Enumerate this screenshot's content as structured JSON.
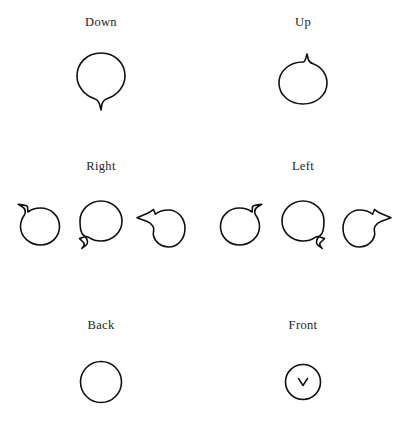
{
  "figure": {
    "background_color": "#ffffff",
    "stroke_color": "#111111",
    "text_color": "#1c1c1c",
    "rows": [
      {
        "name": "down-up",
        "groups": [
          {
            "label": "Down",
            "shapes": [
              {
                "name": "balloon-tail-down",
                "tail_direction": "down",
                "tail_position": "bottom-center",
                "has_chevron": false
              }
            ]
          },
          {
            "label": "Up",
            "shapes": [
              {
                "name": "balloon-tail-up",
                "tail_direction": "up",
                "tail_position": "top-center",
                "has_chevron": false
              }
            ]
          }
        ]
      },
      {
        "name": "right-left",
        "groups": [
          {
            "label": "Right",
            "shapes": [
              {
                "name": "balloon-tail-upper-left",
                "tail_direction": "upper-left",
                "tail_position": "top-left",
                "has_chevron": false
              },
              {
                "name": "balloon-tail-lower-left",
                "tail_direction": "lower-left",
                "tail_position": "bottom-left",
                "has_chevron": false
              },
              {
                "name": "balloon-tail-left",
                "tail_direction": "left",
                "tail_position": "mid-left",
                "has_chevron": false
              }
            ]
          },
          {
            "label": "Left",
            "shapes": [
              {
                "name": "balloon-tail-upper-right",
                "tail_direction": "upper-right",
                "tail_position": "top-right",
                "has_chevron": false
              },
              {
                "name": "balloon-tail-lower-right",
                "tail_direction": "lower-right",
                "tail_position": "bottom-right",
                "has_chevron": false
              },
              {
                "name": "balloon-tail-right",
                "tail_direction": "right",
                "tail_position": "mid-right",
                "has_chevron": false
              }
            ]
          }
        ]
      },
      {
        "name": "back-front",
        "groups": [
          {
            "label": "Back",
            "shapes": [
              {
                "name": "plain-circle",
                "tail_direction": "none",
                "tail_position": "none",
                "has_chevron": false
              }
            ]
          },
          {
            "label": "Front",
            "shapes": [
              {
                "name": "circle-with-chevron",
                "tail_direction": "none",
                "tail_position": "none",
                "has_chevron": true,
                "chevron_glyph": "v"
              }
            ]
          }
        ]
      }
    ]
  }
}
